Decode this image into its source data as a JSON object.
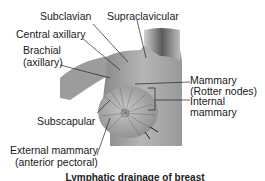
{
  "figure": {
    "labels": {
      "subclavian": "Subclavian",
      "supraclavicular": "Supraclavicular",
      "central_axillary": "Central axillary",
      "brachial_line1": "Brachial",
      "brachial_line2": "(axillary)",
      "mammary_line1": "Mammary",
      "mammary_line2": "(Rotter nodes)",
      "internal_mammary_line1": "Internal",
      "internal_mammary_line2": "mammary",
      "subscapular": "Subscapular",
      "external_mammary_line1": "External mammary",
      "external_mammary_line2": "(anterior pectoral)"
    },
    "caption": "Lymphatic drainage of breast"
  }
}
